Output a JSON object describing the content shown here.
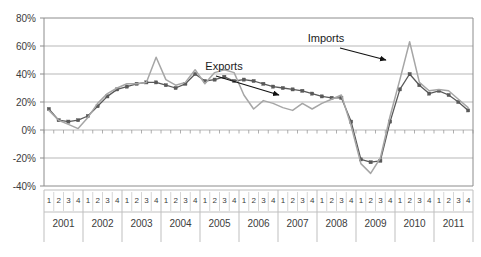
{
  "chart_data": {
    "type": "line",
    "title": "",
    "xlabel": "",
    "ylabel": "",
    "ylim": [
      -40,
      80
    ],
    "ytick_labels": [
      "80%",
      "60%",
      "40%",
      "20%",
      "0%",
      "-20%",
      "-40%"
    ],
    "ytick_values": [
      80,
      60,
      40,
      20,
      0,
      -20,
      -40
    ],
    "grid": true,
    "legend_position": "annotations-on-plot",
    "years": [
      "2001",
      "2002",
      "2003",
      "2004",
      "2005",
      "2006",
      "2007",
      "2008",
      "2009",
      "2010",
      "2011"
    ],
    "quarters": [
      "1",
      "2",
      "3",
      "4"
    ],
    "categories": [
      "2001 1",
      "2001 2",
      "2001 3",
      "2001 4",
      "2002 1",
      "2002 2",
      "2002 3",
      "2002 4",
      "2003 1",
      "2003 2",
      "2003 3",
      "2003 4",
      "2004 1",
      "2004 2",
      "2004 3",
      "2004 4",
      "2005 1",
      "2005 2",
      "2005 3",
      "2005 4",
      "2006 1",
      "2006 2",
      "2006 3",
      "2006 4",
      "2007 1",
      "2007 2",
      "2007 3",
      "2007 4",
      "2008 1",
      "2008 2",
      "2008 3",
      "2008 4",
      "2009 1",
      "2009 2",
      "2009 3",
      "2009 4",
      "2010 1",
      "2010 2",
      "2010 3",
      "2010 4",
      "2011 1",
      "2011 2",
      "2011 3",
      "2011 4"
    ],
    "series": [
      {
        "name": "Exports",
        "color": "#595959",
        "markers": true,
        "values": [
          15,
          7,
          6,
          7,
          10,
          17,
          24,
          29,
          31,
          33,
          34,
          34,
          32,
          30,
          33,
          40,
          35,
          36,
          38,
          35,
          36,
          35,
          33,
          31,
          30,
          29,
          28,
          26,
          24,
          23,
          23,
          6,
          -21,
          -23,
          -22,
          6,
          29,
          40,
          32,
          26,
          28,
          25,
          20,
          14
        ]
      },
      {
        "name": "Imports",
        "color": "#a6a6a6",
        "markers": false,
        "values": [
          14,
          7,
          4,
          1,
          9,
          19,
          26,
          30,
          33,
          33,
          34,
          52,
          36,
          32,
          34,
          43,
          33,
          41,
          43,
          41,
          25,
          15,
          21,
          19,
          16,
          14,
          19,
          15,
          19,
          22,
          25,
          3,
          -24,
          -31,
          -20,
          10,
          36,
          63,
          34,
          28,
          29,
          28,
          22,
          16
        ]
      }
    ],
    "annotations": [
      {
        "text": "Exports",
        "target": "Exports series, ~2006 Q3"
      },
      {
        "text": "Imports",
        "target": "Imports series, ~2009 Q4"
      }
    ]
  }
}
